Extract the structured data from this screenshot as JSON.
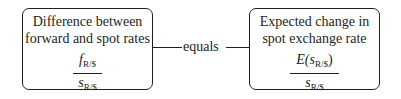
{
  "left_box": {
    "title_line1": "Difference between",
    "title_line2": "forward and spot rates",
    "numerator_var": "f",
    "numerator_sub": "R/$",
    "denominator_var": "s",
    "denominator_sub": "R/$"
  },
  "connector": {
    "label": "equals"
  },
  "right_box": {
    "title_line1": "Expected change in",
    "title_line2": "spot exchange rate",
    "numerator_prefix": "E(",
    "numerator_var": "s",
    "numerator_sub": "R/$",
    "numerator_suffix": ")",
    "denominator_var": "s",
    "denominator_sub": "R/$"
  }
}
